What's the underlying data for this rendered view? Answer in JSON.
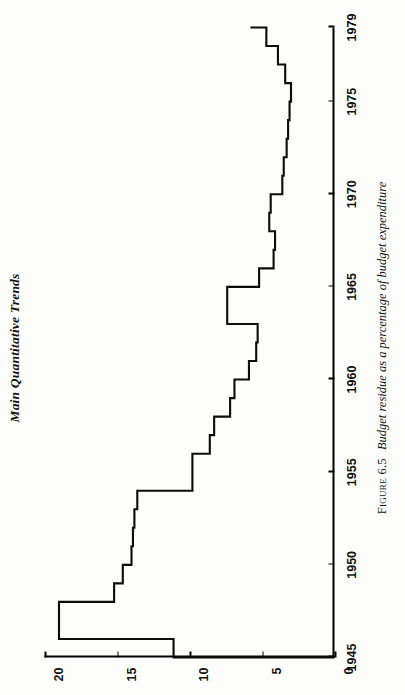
{
  "page": {
    "running_head": "Main Quantitative Trends",
    "page_number": "",
    "caption_number": "Figure 6.5",
    "caption_text": "Budget residue as a percentage of budget expenditure"
  },
  "chart_data": {
    "type": "line",
    "line_style": "step",
    "orientation": "rotated-90-ccw",
    "title": "Budget residue as a percentage of budget expenditure",
    "xlabel": "",
    "ylabel": "",
    "xlim": [
      1945,
      1979
    ],
    "ylim": [
      0,
      20
    ],
    "grid": false,
    "legend": false,
    "x_ticks": [
      1945,
      1950,
      1955,
      1960,
      1965,
      1970,
      1975,
      1979
    ],
    "x_tick_labels": [
      "1945",
      "1950",
      "1955",
      "1960",
      "1965",
      "1970",
      "1975",
      "1979"
    ],
    "y_ticks": [
      0,
      5,
      10,
      15,
      20
    ],
    "y_tick_labels": [
      "0",
      "5",
      "10",
      "15",
      "20"
    ],
    "x": [
      1945,
      1946,
      1947,
      1948,
      1949,
      1950,
      1951,
      1952,
      1953,
      1954,
      1955,
      1956,
      1957,
      1958,
      1959,
      1960,
      1961,
      1962,
      1963,
      1964,
      1965,
      1966,
      1967,
      1968,
      1969,
      1970,
      1971,
      1972,
      1973,
      1974,
      1975,
      1976,
      1977,
      1978,
      1979
    ],
    "values": [
      11.1,
      19.0,
      19.0,
      15.2,
      14.6,
      14.0,
      13.9,
      13.8,
      13.6,
      9.8,
      9.8,
      8.6,
      8.3,
      7.2,
      6.9,
      5.9,
      5.4,
      5.3,
      7.4,
      7.4,
      5.2,
      4.2,
      4.1,
      4.5,
      4.4,
      3.6,
      3.5,
      3.3,
      3.2,
      3.1,
      3.0,
      3.4,
      3.9,
      4.7,
      5.8
    ],
    "series": [
      {
        "name": "Budget residue (% of budget expenditure)",
        "values": [
          11.1,
          19.0,
          19.0,
          15.2,
          14.6,
          14.0,
          13.9,
          13.8,
          13.6,
          9.8,
          9.8,
          8.6,
          8.3,
          7.2,
          6.9,
          5.9,
          5.4,
          5.3,
          7.4,
          7.4,
          5.2,
          4.2,
          4.1,
          4.5,
          4.4,
          3.6,
          3.5,
          3.3,
          3.2,
          3.1,
          3.0,
          3.4,
          3.9,
          4.7,
          5.8
        ]
      }
    ],
    "colors": {
      "line": "#0b0b0b",
      "axis": "#000000",
      "background": "#fdfdfb"
    }
  }
}
